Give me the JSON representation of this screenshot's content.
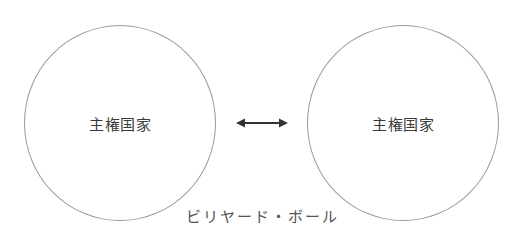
{
  "diagram": {
    "nodes": [
      {
        "id": "left",
        "label": "主権国家"
      },
      {
        "id": "right",
        "label": "主権国家"
      }
    ],
    "edge": {
      "from": "left",
      "to": "right",
      "type": "bidirectional-arrow"
    },
    "caption": "ビリヤード・ボール"
  },
  "colors": {
    "circle_stroke": "#9a9a9a",
    "arrow": "#333333",
    "text": "#3a3a3a"
  }
}
